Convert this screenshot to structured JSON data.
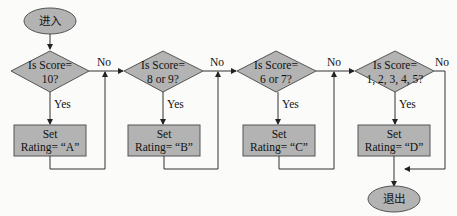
{
  "colors": {
    "node_fill": "#b3b3b3",
    "node_stroke": "#555555",
    "line": "#333333",
    "background": "#fbfbfa"
  },
  "start": {
    "label": "进入"
  },
  "end": {
    "label": "退出"
  },
  "decisions": [
    {
      "line1": "Is Score=",
      "line2": "10?"
    },
    {
      "line1": "Is Score=",
      "line2": "8 or 9?"
    },
    {
      "line1": "Is Score=",
      "line2": "6 or 7?"
    },
    {
      "line1": "Is Score=",
      "line2": "1, 2, 3, 4, 5?"
    }
  ],
  "actions": [
    {
      "line1": "Set",
      "line2": "Rating= “A”"
    },
    {
      "line1": "Set",
      "line2": "Rating= “B”"
    },
    {
      "line1": "Set",
      "line2": "Rating= “C”"
    },
    {
      "line1": "Set",
      "line2": "Rating= “D”"
    }
  ],
  "edge_labels": {
    "yes": [
      "Yes",
      "Yes",
      "Yes",
      "Yes"
    ],
    "no": [
      "No",
      "No",
      "No",
      "No"
    ]
  }
}
